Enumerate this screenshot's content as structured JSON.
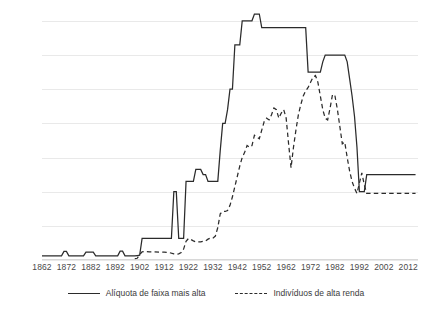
{
  "chart_data": {
    "type": "line",
    "title": "",
    "xlabel": "",
    "ylabel": "",
    "xlim": [
      1862,
      2016
    ],
    "ylim": [
      0,
      72
    ],
    "grid": true,
    "legend_position": "bottom",
    "yticks": [
      0,
      10,
      20,
      30,
      40,
      50,
      60,
      70
    ],
    "xticks": [
      1862,
      1872,
      1882,
      1892,
      1902,
      1912,
      1922,
      1932,
      1942,
      1952,
      1962,
      1972,
      1982,
      1992,
      2002,
      2012
    ],
    "series": [
      {
        "name": "Alíquota de faixa mais alta",
        "style": "solid",
        "color": "#2b2b2b",
        "points": [
          [
            1862,
            1.2
          ],
          [
            1866,
            1.2
          ],
          [
            1867,
            1.2
          ],
          [
            1870,
            1.2
          ],
          [
            1871,
            2.5
          ],
          [
            1872,
            2.5
          ],
          [
            1873,
            1.2
          ],
          [
            1874,
            1.2
          ],
          [
            1877,
            1.2
          ],
          [
            1879,
            1.2
          ],
          [
            1880,
            2.3
          ],
          [
            1881,
            2.3
          ],
          [
            1883,
            2.3
          ],
          [
            1884,
            1.2
          ],
          [
            1886,
            1.2
          ],
          [
            1890,
            1.2
          ],
          [
            1893,
            1.2
          ],
          [
            1894,
            2.6
          ],
          [
            1895,
            2.6
          ],
          [
            1896,
            1.2
          ],
          [
            1897,
            1.2
          ],
          [
            1899,
            1.2
          ],
          [
            1900,
            1.2
          ],
          [
            1901,
            1.3
          ],
          [
            1902,
            1.4
          ],
          [
            1903,
            6.3
          ],
          [
            1905,
            6.3
          ],
          [
            1908,
            6.3
          ],
          [
            1910,
            6.3
          ],
          [
            1912,
            6.3
          ],
          [
            1914,
            6.3
          ],
          [
            1915,
            6.3
          ],
          [
            1916,
            20.0
          ],
          [
            1917,
            20.0
          ],
          [
            1918,
            6.3
          ],
          [
            1919,
            6.3
          ],
          [
            1920,
            6.3
          ],
          [
            1921,
            23.0
          ],
          [
            1922,
            23.0
          ],
          [
            1924,
            23.0
          ],
          [
            1925,
            26.5
          ],
          [
            1926,
            26.5
          ],
          [
            1927,
            26.5
          ],
          [
            1928,
            25.0
          ],
          [
            1929,
            25.0
          ],
          [
            1930,
            23.0
          ],
          [
            1932,
            23.0
          ],
          [
            1934,
            23.0
          ],
          [
            1935,
            32.0
          ],
          [
            1936,
            40.0
          ],
          [
            1937,
            40.0
          ],
          [
            1938,
            44.0
          ],
          [
            1939,
            50.0
          ],
          [
            1940,
            50.0
          ],
          [
            1941,
            63.0
          ],
          [
            1942,
            63.0
          ],
          [
            1943,
            63.0
          ],
          [
            1944,
            70.0
          ],
          [
            1945,
            70.0
          ],
          [
            1946,
            70.0
          ],
          [
            1947,
            70.0
          ],
          [
            1948,
            70.0
          ],
          [
            1949,
            72.0
          ],
          [
            1950,
            72.0
          ],
          [
            1951,
            72.0
          ],
          [
            1952,
            68.0
          ],
          [
            1954,
            68.0
          ],
          [
            1958,
            68.0
          ],
          [
            1962,
            68.0
          ],
          [
            1966,
            68.0
          ],
          [
            1970,
            68.0
          ],
          [
            1971,
            55.0
          ],
          [
            1973,
            55.0
          ],
          [
            1975,
            55.0
          ],
          [
            1976,
            55.0
          ],
          [
            1977,
            58.0
          ],
          [
            1978,
            60.0
          ],
          [
            1979,
            60.0
          ],
          [
            1981,
            60.0
          ],
          [
            1983,
            60.0
          ],
          [
            1985,
            60.0
          ],
          [
            1986,
            60.0
          ],
          [
            1987,
            58.0
          ],
          [
            1988,
            53.0
          ],
          [
            1989,
            48.0
          ],
          [
            1990,
            42.0
          ],
          [
            1991,
            33.0
          ],
          [
            1992,
            20.0
          ],
          [
            1993,
            20.0
          ],
          [
            1994,
            20.0
          ],
          [
            1995,
            25.0
          ],
          [
            1996,
            25.0
          ],
          [
            2000,
            25.0
          ],
          [
            2004,
            25.0
          ],
          [
            2008,
            25.0
          ],
          [
            2012,
            25.0
          ],
          [
            2015,
            25.0
          ]
        ]
      },
      {
        "name": "Indivíduos de alta renda",
        "style": "dashed",
        "color": "#2b2b2b",
        "points": [
          [
            1900,
            0.4
          ],
          [
            1901,
            0.5
          ],
          [
            1902,
            1.6
          ],
          [
            1903,
            2.4
          ],
          [
            1904,
            2.5
          ],
          [
            1906,
            2.4
          ],
          [
            1908,
            2.4
          ],
          [
            1910,
            2.3
          ],
          [
            1912,
            2.3
          ],
          [
            1914,
            2.2
          ],
          [
            1916,
            1.8
          ],
          [
            1917,
            1.7
          ],
          [
            1918,
            1.8
          ],
          [
            1919,
            2.2
          ],
          [
            1920,
            3.2
          ],
          [
            1921,
            5.5
          ],
          [
            1922,
            6.3
          ],
          [
            1923,
            6.0
          ],
          [
            1924,
            5.6
          ],
          [
            1925,
            5.3
          ],
          [
            1927,
            5.3
          ],
          [
            1929,
            5.6
          ],
          [
            1930,
            6.1
          ],
          [
            1931,
            6.4
          ],
          [
            1932,
            6.4
          ],
          [
            1933,
            7.0
          ],
          [
            1934,
            9.5
          ],
          [
            1935,
            13.5
          ],
          [
            1936,
            14.2
          ],
          [
            1937,
            14.2
          ],
          [
            1938,
            14.5
          ],
          [
            1939,
            16.0
          ],
          [
            1940,
            18.5
          ],
          [
            1941,
            21.5
          ],
          [
            1942,
            24.5
          ],
          [
            1943,
            27.5
          ],
          [
            1944,
            30.0
          ],
          [
            1945,
            31.5
          ],
          [
            1946,
            33.5
          ],
          [
            1947,
            33.0
          ],
          [
            1948,
            33.5
          ],
          [
            1949,
            36.5
          ],
          [
            1950,
            36.0
          ],
          [
            1951,
            35.5
          ],
          [
            1952,
            38.0
          ],
          [
            1953,
            40.5
          ],
          [
            1954,
            41.5
          ],
          [
            1955,
            41.0
          ],
          [
            1956,
            42.5
          ],
          [
            1957,
            44.5
          ],
          [
            1958,
            44.0
          ],
          [
            1959,
            41.5
          ],
          [
            1960,
            43.0
          ],
          [
            1961,
            44.0
          ],
          [
            1962,
            41.5
          ],
          [
            1963,
            34.0
          ],
          [
            1964,
            27.0
          ],
          [
            1965,
            33.0
          ],
          [
            1966,
            38.0
          ],
          [
            1967,
            42.5
          ],
          [
            1968,
            45.5
          ],
          [
            1969,
            48.0
          ],
          [
            1970,
            49.5
          ],
          [
            1971,
            50.5
          ],
          [
            1972,
            52.0
          ],
          [
            1973,
            53.5
          ],
          [
            1974,
            54.0
          ],
          [
            1975,
            52.0
          ],
          [
            1976,
            48.0
          ],
          [
            1977,
            44.0
          ],
          [
            1978,
            41.5
          ],
          [
            1979,
            41.0
          ],
          [
            1980,
            44.5
          ],
          [
            1981,
            48.5
          ],
          [
            1982,
            48.0
          ],
          [
            1983,
            44.0
          ],
          [
            1984,
            39.0
          ],
          [
            1985,
            34.0
          ],
          [
            1986,
            34.5
          ],
          [
            1987,
            30.0
          ],
          [
            1988,
            26.0
          ],
          [
            1989,
            23.0
          ],
          [
            1990,
            21.0
          ],
          [
            1991,
            19.5
          ],
          [
            1992,
            22.5
          ],
          [
            1993,
            25.5
          ],
          [
            1994,
            22.0
          ],
          [
            1995,
            19.5
          ],
          [
            1996,
            19.5
          ],
          [
            1998,
            19.5
          ],
          [
            2000,
            19.5
          ],
          [
            2002,
            19.5
          ],
          [
            2004,
            19.5
          ],
          [
            2006,
            19.5
          ],
          [
            2008,
            19.5
          ],
          [
            2010,
            19.5
          ],
          [
            2012,
            19.5
          ],
          [
            2015,
            19.5
          ]
        ]
      }
    ]
  },
  "legend": {
    "items": [
      {
        "label": "Alíquota de faixa mais alta",
        "style": "solid"
      },
      {
        "label": "Indivíduos de alta renda",
        "style": "dashed"
      }
    ]
  },
  "colors": {
    "line": "#2b2b2b",
    "grid": "#e9e9e9",
    "text": "#3b3b3b",
    "background": "#ffffff"
  }
}
